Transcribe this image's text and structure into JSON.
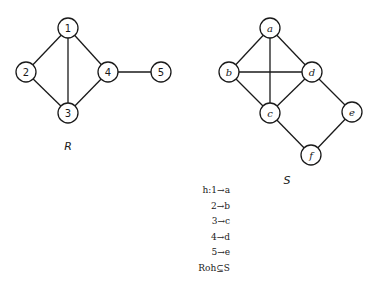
{
  "graphs": [
    {
      "name": "R",
      "label": "R",
      "label_pos": [
        68,
        150
      ],
      "node_style": "upright",
      "nodes": [
        {
          "id": "1",
          "label": "1",
          "x": 68,
          "y": 28
        },
        {
          "id": "2",
          "label": "2",
          "x": 26,
          "y": 72
        },
        {
          "id": "3",
          "label": "3",
          "x": 68,
          "y": 113
        },
        {
          "id": "4",
          "label": "4",
          "x": 108,
          "y": 72
        },
        {
          "id": "5",
          "label": "5",
          "x": 161,
          "y": 72
        }
      ],
      "edges": [
        [
          "1",
          "2"
        ],
        [
          "1",
          "3"
        ],
        [
          "1",
          "4"
        ],
        [
          "2",
          "3"
        ],
        [
          "3",
          "4"
        ],
        [
          "4",
          "5"
        ]
      ]
    },
    {
      "name": "S",
      "label": "S",
      "label_pos": [
        287,
        184
      ],
      "node_style": "italic",
      "nodes": [
        {
          "id": "a",
          "label": "a",
          "x": 270,
          "y": 28
        },
        {
          "id": "b",
          "label": "b",
          "x": 229,
          "y": 72
        },
        {
          "id": "c",
          "label": "c",
          "x": 270,
          "y": 113
        },
        {
          "id": "d",
          "label": "d",
          "x": 312,
          "y": 72
        },
        {
          "id": "e",
          "label": "e",
          "x": 352,
          "y": 112
        },
        {
          "id": "f",
          "label": "f",
          "x": 311,
          "y": 155
        }
      ],
      "edges": [
        [
          "a",
          "b"
        ],
        [
          "a",
          "c"
        ],
        [
          "a",
          "d"
        ],
        [
          "b",
          "c"
        ],
        [
          "b",
          "d"
        ],
        [
          "c",
          "d"
        ],
        [
          "d",
          "e"
        ],
        [
          "c",
          "f"
        ],
        [
          "e",
          "f"
        ]
      ]
    }
  ],
  "node_radius": 10,
  "mapping": {
    "lines": [
      "h:1→a",
      "2→b",
      "3→c",
      "4→d",
      "5→e",
      "Roh⊆S"
    ]
  }
}
